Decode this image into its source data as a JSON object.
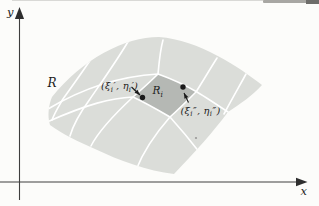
{
  "figure": {
    "labels": {
      "y_axis": "y",
      "x_axis": "x",
      "region": "R",
      "subregion": {
        "base": "R",
        "sub": "i"
      },
      "point1": {
        "parts": [
          "(ξ",
          "i",
          "′, η",
          "i",
          "′)"
        ]
      },
      "point2": {
        "parts": [
          "(ξ",
          "i",
          "″, η",
          "i",
          "″)"
        ]
      }
    },
    "colors": {
      "background": "#fcfcfa",
      "region_fill": "#dbddd9",
      "subregion_fill": "#b5b8b4",
      "grid_line": "#ffffff",
      "axis": "#3e3e3e",
      "ink": "#1a1a1a",
      "speck": "#9a9998"
    },
    "geometry": {
      "region_path": "M52,97 C83,59 124,37 159,37 C199,40 239,67 262,85 C252,96 240,104 228,112 C214,131 195,152 174,174 C148,171 118,160 95,149 C79,142 62,134 50,125 C47,115 49,104 52,97 Z",
      "subregion_path": "M158,74 C172,79 185,85 197,92 C188,100 179,109 170,117 C158,110 146,103 133,97 C141,90 149,83 158,74 Z",
      "grid_paths": [
        "M97,50 C86,67 73,85 63,99 C59,106 55,112 52,120",
        "M129,40 C118,59 103,80 90,99 C82,110 74,122 70,136",
        "M163,40 C160,51 159,63 158,74 C149,83 141,90 133,97 C118,111 99,130 91,146",
        "M217,58 C210,69 203,81 196,92 C188,100 179,109 170,117 C156,133 143,152 136,170",
        "M246,74 C240,85 232,99 224,114",
        "M48,109 C88,85 124,76 158,74 C172,79 185,85 197,92 C207,98 219,106 231,114",
        "M47,122 C88,104 111,98 133,97 C146,103 158,110 170,117 C179,127 190,140 200,153"
      ],
      "y_axis": {
        "x": 19.5,
        "line_y1": 16,
        "line_y2": 200,
        "tip": [
          19.5,
          7
        ],
        "head_len": 12,
        "head_w": 4.6
      },
      "x_axis": {
        "y": 182,
        "line_x1": 0,
        "line_x2": 298,
        "tip": [
          307.5,
          182
        ],
        "head_len": 11.5,
        "head_w": 4.3
      },
      "points": [
        [
          142.5,
          97.5
        ],
        [
          183,
          87
        ]
      ],
      "point_radius": 2.7,
      "pointer_arrows": [
        {
          "from": [
            131.5,
            87
          ],
          "to": [
            140,
            95
          ]
        },
        {
          "from": [
            188.5,
            102.5
          ],
          "to": [
            184,
            93
          ]
        }
      ],
      "speck": [
        196,
        138
      ]
    }
  }
}
